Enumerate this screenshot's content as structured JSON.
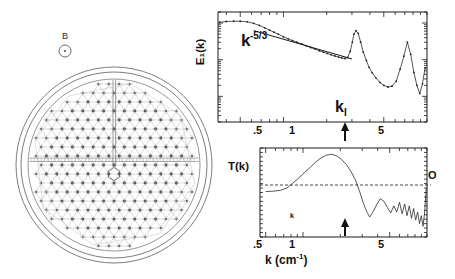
{
  "figure": {
    "panels": [
      "vortex-lattice-diagram",
      "energy-spectrum-chart",
      "transfer-function-chart"
    ]
  },
  "left_diagram": {
    "name": "vortex-lattice-vessel",
    "field_label": "B",
    "field_symbol": "circle-dot",
    "description": "Circular vessel containing triangular vortex lattice with central hexagonal cell"
  },
  "chart_data": [
    {
      "type": "line",
      "name": "energy-spectrum",
      "title": "",
      "xlabel": "",
      "ylabel": "E₁(k)",
      "xscale": "log",
      "yscale": "log",
      "xlim": [
        0.35,
        10
      ],
      "ylim": [
        0.002,
        2
      ],
      "xticks": [
        0.5,
        1,
        5
      ],
      "xticklabels": [
        ".5",
        "1",
        "5"
      ],
      "grid": false,
      "annotations": [
        {
          "text": "k",
          "sup": "-5/3",
          "x": 0.62,
          "y": 0.55,
          "name": "power-law-annotation"
        },
        {
          "text": "k",
          "sub": "I",
          "x": 3.1,
          "y": 0.012,
          "name": "ki-arrow-label"
        }
      ],
      "arrows": [
        {
          "name": "ki-arrow",
          "x": 3.1,
          "direction": "up"
        }
      ],
      "fit_line": {
        "name": "k-minus-five-thirds-fit",
        "slope": -1.6667,
        "x": [
          0.62,
          3.0
        ],
        "y": [
          0.62,
          0.105
        ]
      },
      "series": [
        {
          "name": "E1(k)",
          "x": [
            0.36,
            0.4,
            0.45,
            0.5,
            0.56,
            0.62,
            0.68,
            0.74,
            0.8,
            0.86,
            0.92,
            1.0,
            1.08,
            1.16,
            1.24,
            1.34,
            1.44,
            1.55,
            1.66,
            1.78,
            1.9,
            2.02,
            2.15,
            2.28,
            2.42,
            2.55,
            2.68,
            2.8,
            2.92,
            3.02,
            3.1,
            3.2,
            3.32,
            3.45,
            3.6,
            3.78,
            3.95,
            4.15,
            4.4,
            4.7,
            5.0,
            5.35,
            5.7,
            6.1,
            6.5,
            6.9,
            7.3,
            7.7,
            8.1,
            8.5,
            8.9,
            9.3,
            9.7
          ],
          "y": [
            1.05,
            1.1,
            1.12,
            1.12,
            1.08,
            0.98,
            0.86,
            0.74,
            0.64,
            0.56,
            0.5,
            0.42,
            0.37,
            0.33,
            0.3,
            0.27,
            0.24,
            0.215,
            0.195,
            0.175,
            0.16,
            0.148,
            0.136,
            0.126,
            0.118,
            0.112,
            0.108,
            0.115,
            0.17,
            0.3,
            0.5,
            0.62,
            0.52,
            0.3,
            0.16,
            0.095,
            0.062,
            0.044,
            0.032,
            0.024,
            0.02,
            0.018,
            0.019,
            0.026,
            0.055,
            0.125,
            0.3,
            0.14,
            0.045,
            0.02,
            0.012,
            0.022,
            0.06
          ]
        }
      ]
    },
    {
      "type": "line",
      "name": "transfer-function",
      "title": "",
      "xlabel": "k (cm⁻¹)",
      "ylabel": "T(k)",
      "xscale": "log",
      "xlim": [
        0.45,
        10
      ],
      "ylim": [
        -1.0,
        1.0
      ],
      "xticks": [
        0.5,
        1,
        5
      ],
      "xticklabels": [
        ".5",
        "1",
        "5"
      ],
      "zero_line_label": "O",
      "grid": false,
      "annotations": [
        {
          "text": "k",
          "x": 3.1,
          "y": -0.62,
          "name": "ki-small-label"
        }
      ],
      "arrows": [
        {
          "name": "ki-arrow",
          "x": 3.1,
          "direction": "up"
        }
      ],
      "series": [
        {
          "name": "T(k)",
          "x": [
            0.5,
            0.58,
            0.66,
            0.74,
            0.82,
            0.92,
            1.02,
            1.14,
            1.26,
            1.4,
            1.55,
            1.7,
            1.88,
            2.05,
            2.25,
            2.45,
            2.65,
            2.85,
            3.05,
            3.25,
            3.45,
            3.7,
            3.95,
            4.2,
            4.5,
            4.8,
            5.1,
            5.4,
            5.7,
            6.0,
            6.3,
            6.6,
            6.9,
            7.2,
            7.5,
            7.8,
            8.1,
            8.4,
            8.7,
            9.0,
            9.3,
            9.6,
            9.85
          ],
          "y": [
            0.02,
            0.03,
            0.05,
            0.1,
            0.2,
            0.32,
            0.44,
            0.56,
            0.68,
            0.78,
            0.84,
            0.86,
            0.82,
            0.74,
            0.62,
            0.46,
            0.28,
            0.04,
            -0.22,
            -0.42,
            -0.55,
            -0.42,
            -0.26,
            -0.14,
            -0.2,
            -0.34,
            -0.46,
            -0.3,
            -0.44,
            -0.22,
            -0.48,
            -0.26,
            -0.52,
            -0.3,
            -0.58,
            -0.36,
            -0.62,
            -0.44,
            -0.7,
            -0.52,
            -0.76,
            -0.4,
            0.1
          ]
        }
      ]
    }
  ]
}
